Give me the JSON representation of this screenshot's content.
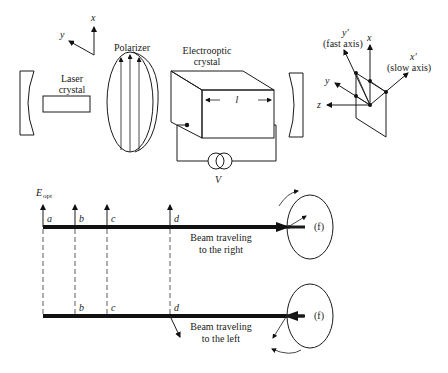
{
  "top": {
    "coords": {
      "x_label": "x",
      "y_label": "y"
    },
    "laser_crystal": {
      "line1": "Laser",
      "line2": "crystal"
    },
    "polarizer": {
      "label": "Polarizer"
    },
    "eo_crystal": {
      "line1": "Electrooptic",
      "line2": "crystal",
      "length_label": "l",
      "voltage_label": "V"
    },
    "axes": {
      "y_prime": "y'",
      "fast": "(fast axis)",
      "x": "x",
      "x_prime": "x'",
      "slow": "(slow axis)",
      "y": "y",
      "z": "z"
    }
  },
  "bottom": {
    "field_label": "E",
    "field_sub": "opt",
    "points_top": [
      "a",
      "b",
      "c",
      "d"
    ],
    "points_bottom": [
      "b",
      "c",
      "d"
    ],
    "right_beam": {
      "line1": "Beam traveling",
      "line2": "to the right",
      "end_label": "(f)"
    },
    "left_beam": {
      "line1": "Beam traveling",
      "line2": "to the left",
      "end_label": "(f)"
    }
  }
}
